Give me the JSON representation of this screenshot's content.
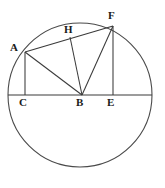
{
  "figure": {
    "type": "geometry-diagram",
    "background_color": "#ffffff",
    "stroke_color": "#3a3a3a",
    "label_color": "#1a1a1a",
    "canvas": {
      "width": 165,
      "height": 188
    }
  },
  "circle": {
    "name": "main-circle",
    "center_x": 80,
    "center_y": 95,
    "radius": 72,
    "stroke_color": "#4a4a4a",
    "stroke_width": 1.1,
    "fill": "none"
  },
  "points": [
    {
      "id": "A",
      "label": "A",
      "x": 25,
      "y": 52,
      "label_x": 10,
      "label_y": 42
    },
    {
      "id": "H",
      "label": "H",
      "x": 70,
      "y": 37,
      "label_x": 64,
      "label_y": 24
    },
    {
      "id": "F",
      "label": "F",
      "x": 113,
      "y": 26,
      "label_x": 108,
      "label_y": 10
    },
    {
      "id": "C",
      "label": "C",
      "x": 25,
      "y": 95,
      "label_x": 19,
      "label_y": 97
    },
    {
      "id": "B",
      "label": "B",
      "x": 82,
      "y": 95,
      "label_x": 76,
      "label_y": 97
    },
    {
      "id": "E",
      "label": "E",
      "x": 113,
      "y": 95,
      "label_x": 107,
      "label_y": 97
    }
  ],
  "segments": [
    {
      "id": "CE-diameter",
      "name": "horizontal-diameter",
      "from": "left-rim",
      "to": "right-rim",
      "x1": 8,
      "y1": 95,
      "x2": 152,
      "y2": 95
    },
    {
      "id": "AC",
      "name": "segment-a-c",
      "from": "A",
      "to": "C",
      "x1": 25,
      "y1": 52,
      "x2": 25,
      "y2": 95
    },
    {
      "id": "AB",
      "name": "segment-a-b",
      "from": "A",
      "to": "B",
      "x1": 25,
      "y1": 52,
      "x2": 82,
      "y2": 95
    },
    {
      "id": "AF",
      "name": "segment-a-f",
      "from": "A",
      "to": "F",
      "x1": 25,
      "y1": 52,
      "x2": 113,
      "y2": 26
    },
    {
      "id": "BH",
      "name": "segment-b-h",
      "from": "B",
      "to": "H",
      "x1": 82,
      "y1": 95,
      "x2": 70,
      "y2": 37
    },
    {
      "id": "BF",
      "name": "segment-b-f",
      "from": "B",
      "to": "F",
      "x1": 82,
      "y1": 95,
      "x2": 113,
      "y2": 26
    },
    {
      "id": "FE",
      "name": "segment-f-e",
      "from": "F",
      "to": "E",
      "x1": 113,
      "y1": 26,
      "x2": 113,
      "y2": 95
    }
  ]
}
